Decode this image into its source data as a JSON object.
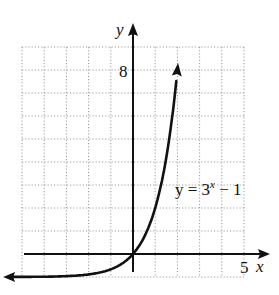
{
  "chart_data": {
    "type": "line",
    "title": "",
    "function_label": "y = 3^x − 1",
    "label_parts": {
      "base": "y = 3",
      "exponent": "x",
      "tail": " − 1"
    },
    "xlabel": "x",
    "ylabel": "y",
    "x_tick_labels": [
      {
        "value": 5,
        "label": "5"
      }
    ],
    "y_tick_labels": [
      {
        "value": 8,
        "label": "8"
      }
    ],
    "xlim": [
      -5,
      5
    ],
    "ylim": [
      -1,
      9
    ],
    "grid": true,
    "grid_step": 1,
    "asymptote": -1,
    "series": [
      {
        "name": "y = 3^x − 1",
        "x": [
          -5.8,
          -4,
          -3,
          -2,
          -1,
          -0.5,
          0,
          0.5,
          1,
          1.5,
          2,
          2.05
        ],
        "y": [
          -1,
          -0.988,
          -0.963,
          -0.889,
          -0.667,
          -0.423,
          0,
          0.732,
          2,
          4.196,
          8,
          8.5
        ]
      }
    ],
    "axis_color": "#111111",
    "curve_color": "#111111",
    "grid_color": "#9a9a9a"
  }
}
